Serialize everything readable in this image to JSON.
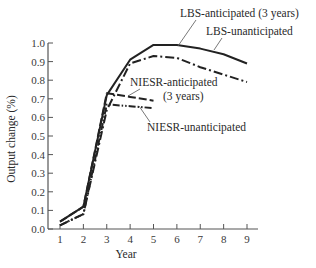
{
  "chart_data": {
    "type": "line",
    "title": "",
    "xlabel": "Year",
    "ylabel": "Output change (%)",
    "x": [
      1,
      2,
      3,
      4,
      5,
      6,
      7,
      8,
      9
    ],
    "xlim": [
      1,
      9
    ],
    "ylim": [
      0.0,
      1.0
    ],
    "x_ticks": [
      "1",
      "2",
      "3",
      "4",
      "5",
      "6",
      "7",
      "8",
      "9"
    ],
    "y_ticks": [
      "0.0",
      "0.1",
      "0.2",
      "0.3",
      "0.4",
      "0.5",
      "0.6",
      "0.7",
      "0.8",
      "0.9",
      "1.0"
    ],
    "grid": false,
    "legend": "none (direct annotations)",
    "series": [
      {
        "name": "LBS-unanticipated",
        "style": "solid",
        "x": [
          1,
          2,
          3,
          4,
          5,
          6,
          7,
          8,
          9
        ],
        "values": [
          0.04,
          0.12,
          0.72,
          0.91,
          0.99,
          0.99,
          0.97,
          0.94,
          0.89
        ]
      },
      {
        "name": "LBS-anticipated (3 years)",
        "style": "dash-dot",
        "x": [
          1,
          2,
          3,
          4,
          5,
          6,
          7,
          8,
          9
        ],
        "values": [
          0.02,
          0.08,
          0.64,
          0.89,
          0.93,
          0.92,
          0.87,
          0.83,
          0.79
        ]
      },
      {
        "name": "NIESR-anticipated (3 years)",
        "style": "dashed",
        "x": [
          1,
          2,
          3,
          4,
          5
        ],
        "values": [
          0.04,
          0.12,
          0.73,
          0.71,
          0.69
        ]
      },
      {
        "name": "NIESR-unanticipated",
        "style": "dash-dot-dot",
        "x": [
          1,
          2,
          3,
          4,
          5
        ],
        "values": [
          0.02,
          0.08,
          0.67,
          0.66,
          0.65
        ]
      }
    ],
    "annotations": [
      {
        "text": "LBS-anticipated (3 years)",
        "points_to": "LBS-anticipated (3 years)"
      },
      {
        "text": "LBS-unanticipated",
        "points_to": "LBS-unanticipated"
      },
      {
        "text": "NIESR-anticipated",
        "text2": "(3 years)",
        "points_to": "NIESR-anticipated (3 years)"
      },
      {
        "text": "NIESR-unanticipated",
        "points_to": "NIESR-unanticipated"
      }
    ]
  },
  "labels": {
    "xlabel": "Year",
    "ylabel": "Output change (%)",
    "lbs_ant": "LBS-anticipated (3 years)",
    "lbs_unant": "LBS-unanticipated",
    "niesr_ant_1": "NIESR-anticipated",
    "niesr_ant_2": "(3 years)",
    "niesr_unant": "NIESR-unanticipated"
  }
}
